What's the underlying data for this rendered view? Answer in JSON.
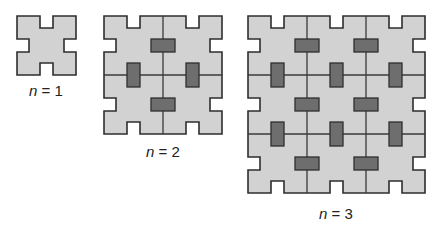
{
  "figure": {
    "colors": {
      "tile_fill": "#d2d2d2",
      "outline": "#2e2e2e",
      "inner_line": "#3a3a3a",
      "connector_fill": "#6e6e6e",
      "label": "#222222"
    },
    "tile_size": 59,
    "notch": {
      "start": 23,
      "width": 13,
      "depth": 12
    },
    "panels": [
      {
        "n": 1,
        "x": 17,
        "y": 16,
        "label_var": "n",
        "label_rest": " = 1",
        "label_x": 46,
        "label_y": 82
      },
      {
        "n": 2,
        "x": 104,
        "y": 16,
        "label_var": "n",
        "label_rest": " = 2",
        "label_x": 163,
        "label_y": 143
      },
      {
        "n": 3,
        "x": 248,
        "y": 16,
        "label_var": "n",
        "label_rest": " = 3",
        "label_x": 336,
        "label_y": 205
      }
    ]
  }
}
